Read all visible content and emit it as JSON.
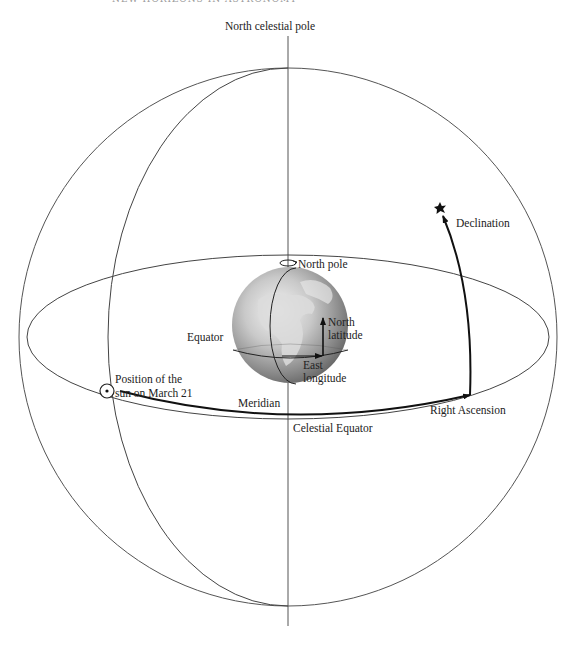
{
  "running_head": {
    "page_number": "———",
    "title": "NEW HORIZONS IN ASTRONOMY"
  },
  "diagram": {
    "labels": {
      "north_celestial_pole": "North celestial pole",
      "north_pole": "North pole",
      "declination": "Declination",
      "north_latitude_line1": "North",
      "north_latitude_line2": "latitude",
      "equator": "Equator",
      "east_longitude_line1": "East",
      "east_longitude_line2": "longitude",
      "sun_position_line1": "Position of the",
      "sun_position_line2": "sun on March 21",
      "meridian": "Meridian",
      "right_ascension": "Right Ascension",
      "celestial_equator": "Celestial Equator"
    },
    "icons": {
      "sun": "circled-dot",
      "star": "star-burst",
      "rotation": "rotation-arrow"
    },
    "colors": {
      "line": "#555555",
      "bold_line": "#111111",
      "background": "#ffffff"
    }
  }
}
